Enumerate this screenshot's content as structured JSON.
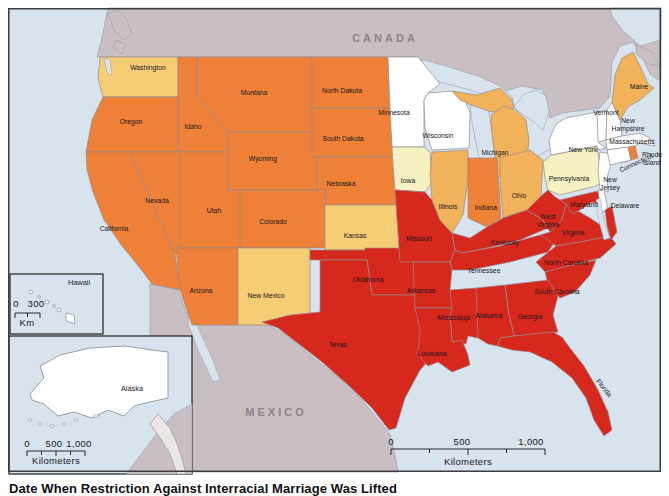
{
  "figure": {
    "caption": "Date When Restriction Against Interracial Marriage Was Lifted"
  },
  "map": {
    "region_labels": {
      "north": "CANADA",
      "south": "MEXICO"
    },
    "palette": {
      "ocean": "#D7E4EE",
      "foreign_land": "#C9BFC3",
      "no_law": "#FFFFFF",
      "pale_yellow": "#F5F1C0",
      "light_goldenrod": "#F6CC74",
      "goldenrod": "#F1B25A",
      "orange": "#EF8038",
      "red": "#D7281D",
      "state_border": "#97898E"
    },
    "categories": [
      {
        "id": "no_law",
        "color": "#FFFFFF",
        "states": [
          "Minnesota",
          "Wisconsin",
          "New York",
          "Vermont",
          "New Hampshire",
          "Massachusetts",
          "Connecticut",
          "New Jersey",
          "Delaware",
          "Alaska",
          "Hawaii"
        ]
      },
      {
        "id": "pale_yellow",
        "color": "#F5F1C0",
        "states": [
          "Iowa",
          "Pennsylvania"
        ]
      },
      {
        "id": "light_goldenrod",
        "color": "#F6CC74",
        "states": [
          "Washington",
          "Kansas",
          "New Mexico"
        ]
      },
      {
        "id": "goldenrod",
        "color": "#F1B25A",
        "states": [
          "Illinois",
          "Michigan",
          "Ohio",
          "Maine"
        ]
      },
      {
        "id": "orange",
        "color": "#EF8038",
        "states": [
          "Oregon",
          "Idaho",
          "Montana",
          "Wyoming",
          "Nevada",
          "Utah",
          "California",
          "Colorado",
          "Arizona",
          "North Dakota",
          "South Dakota",
          "Nebraska",
          "Indiana",
          "Rhode Island"
        ]
      },
      {
        "id": "red",
        "color": "#D7281D",
        "states": [
          "Missouri",
          "Oklahoma",
          "Texas",
          "Arkansas",
          "Louisiana",
          "Kentucky",
          "Tennessee",
          "Mississippi",
          "Alabama",
          "Georgia",
          "Florida",
          "South Carolina",
          "North Carolina",
          "Virginia",
          "West Virginia",
          "Maryland"
        ]
      }
    ],
    "state_categories": {
      "washington": "light_goldenrod",
      "oregon": "orange",
      "california": "orange",
      "nevada": "orange",
      "idaho": "orange",
      "montana": "orange",
      "wyoming": "orange",
      "utah": "orange",
      "arizona": "orange",
      "colorado": "orange",
      "new_mexico": "light_goldenrod",
      "north_dakota": "orange",
      "south_dakota": "orange",
      "nebraska": "orange",
      "kansas": "light_goldenrod",
      "oklahoma": "red",
      "texas": "red",
      "minnesota": "no_law",
      "iowa": "pale_yellow",
      "missouri": "red",
      "arkansas": "red",
      "louisiana": "red",
      "wisconsin": "no_law",
      "illinois": "goldenrod",
      "michigan": "goldenrod",
      "indiana": "orange",
      "ohio": "goldenrod",
      "kentucky": "red",
      "tennessee": "red",
      "mississippi": "red",
      "alabama": "red",
      "georgia": "red",
      "florida": "red",
      "south_carolina": "red",
      "north_carolina": "red",
      "virginia": "red",
      "west_virginia": "red",
      "maryland": "red",
      "delaware": "no_law",
      "pennsylvania": "pale_yellow",
      "new_jersey": "no_law",
      "new_york": "no_law",
      "vermont": "no_law",
      "new_hampshire": "no_law",
      "massachusetts": "no_law",
      "connecticut": "no_law",
      "rhode_island": "orange",
      "maine": "goldenrod",
      "alaska": "no_law",
      "hawaii": "no_law"
    },
    "labels": [
      {
        "id": "washington",
        "text": "Washington",
        "x": 148,
        "y": 68
      },
      {
        "id": "oregon",
        "text": "Oregon",
        "x": 131,
        "y": 122
      },
      {
        "id": "california",
        "text": "California",
        "x": 114,
        "y": 229
      },
      {
        "id": "nevada",
        "text": "Nevada",
        "x": 157,
        "y": 201
      },
      {
        "id": "idaho",
        "text": "Idaho",
        "x": 193,
        "y": 127
      },
      {
        "id": "montana",
        "text": "Montana",
        "x": 254,
        "y": 93
      },
      {
        "id": "wyoming",
        "text": "Wyoming",
        "x": 263,
        "y": 159
      },
      {
        "id": "utah",
        "text": "Utah",
        "x": 214,
        "y": 211
      },
      {
        "id": "arizona",
        "text": "Arizona",
        "x": 201,
        "y": 291
      },
      {
        "id": "colorado",
        "text": "Colorado",
        "x": 273,
        "y": 222
      },
      {
        "id": "new-mexico",
        "text": "New Mexico",
        "x": 266,
        "y": 296
      },
      {
        "id": "north-dakota",
        "text": "North Dakota",
        "x": 342,
        "y": 91
      },
      {
        "id": "south-dakota",
        "text": "South Dakota",
        "x": 343,
        "y": 139
      },
      {
        "id": "nebraska",
        "text": "Nebraska",
        "x": 341,
        "y": 184
      },
      {
        "id": "kansas",
        "text": "Kansas",
        "x": 355,
        "y": 236
      },
      {
        "id": "oklahoma",
        "text": "Oklahoma",
        "x": 368,
        "y": 280
      },
      {
        "id": "texas",
        "text": "Texas",
        "x": 338,
        "y": 345
      },
      {
        "id": "minnesota",
        "text": "Minnesota",
        "x": 394,
        "y": 113
      },
      {
        "id": "iowa",
        "text": "Iowa",
        "x": 408,
        "y": 181
      },
      {
        "id": "missouri",
        "text": "Missouri",
        "x": 419,
        "y": 239
      },
      {
        "id": "arkansas",
        "text": "Arkansas",
        "x": 421,
        "y": 291
      },
      {
        "id": "louisiana",
        "text": "Louisiana",
        "x": 432,
        "y": 354
      },
      {
        "id": "wisconsin",
        "text": "Wisconsin",
        "x": 438,
        "y": 136
      },
      {
        "id": "illinois",
        "text": "Illinois",
        "x": 448,
        "y": 207
      },
      {
        "id": "michigan",
        "text": "Michigan",
        "x": 495,
        "y": 153
      },
      {
        "id": "indiana",
        "text": "Indiana",
        "x": 486,
        "y": 208
      },
      {
        "id": "ohio",
        "text": "Ohio",
        "x": 519,
        "y": 196
      },
      {
        "id": "kentucky",
        "text": "Kentucky",
        "x": 505,
        "y": 243
      },
      {
        "id": "tennessee",
        "text": "Tennessee",
        "x": 484,
        "y": 271
      },
      {
        "id": "mississippi",
        "text": "Mississippi",
        "x": 454,
        "y": 318
      },
      {
        "id": "alabama",
        "text": "Alabama",
        "x": 489,
        "y": 316
      },
      {
        "id": "georgia",
        "text": "Georgia",
        "x": 530,
        "y": 317
      },
      {
        "id": "florida",
        "text": "Florida",
        "x": 604,
        "y": 388,
        "rot": 52
      },
      {
        "id": "south-carolina",
        "text": "South Carolina",
        "x": 557,
        "y": 292
      },
      {
        "id": "north-carolina",
        "text": "North Carolina",
        "x": 566,
        "y": 263
      },
      {
        "id": "virginia",
        "text": "Virginia",
        "x": 573,
        "y": 233
      },
      {
        "id": "west-virginia",
        "text": "West\nVirginia",
        "x": 548,
        "y": 221
      },
      {
        "id": "maryland",
        "text": "Maryland",
        "x": 584,
        "y": 205
      },
      {
        "id": "delaware",
        "text": "Delaware",
        "x": 625,
        "y": 206
      },
      {
        "id": "pennsylvania",
        "text": "Pennsylvania",
        "x": 569,
        "y": 179
      },
      {
        "id": "new-jersey",
        "text": "New\nJersey",
        "x": 610,
        "y": 184
      },
      {
        "id": "new-york",
        "text": "New York",
        "x": 583,
        "y": 150
      },
      {
        "id": "vermont",
        "text": "Vermont",
        "x": 606,
        "y": 113
      },
      {
        "id": "new-hampshire",
        "text": "New\nHampshire",
        "x": 628,
        "y": 125
      },
      {
        "id": "massachusetts",
        "text": "Massachusetts",
        "x": 632,
        "y": 142
      },
      {
        "id": "connecticut",
        "text": "Connecticut",
        "x": 636,
        "y": 163,
        "rot": -25
      },
      {
        "id": "rhode-island",
        "text": "Rhode\nIsland",
        "x": 652,
        "y": 159
      },
      {
        "id": "maine",
        "text": "Maine",
        "x": 639,
        "y": 87
      },
      {
        "id": "hawaii",
        "text": "Hawaii",
        "x": 79,
        "y": 283,
        "cls": "inset-name"
      },
      {
        "id": "alaska",
        "text": "Alaska",
        "x": 132,
        "y": 389,
        "cls": "inset-name"
      },
      {
        "id": "canada",
        "text": "CANADA",
        "x": 385,
        "y": 38,
        "cls": "region"
      },
      {
        "id": "mexico",
        "text": "MEXICO",
        "x": 276,
        "y": 412,
        "cls": "region"
      },
      {
        "id": "main-scale-0",
        "text": "0",
        "x": 391,
        "y": 442,
        "cls": "scale"
      },
      {
        "id": "main-scale-500",
        "text": "500",
        "x": 462,
        "y": 442,
        "cls": "scale"
      },
      {
        "id": "main-scale-1000",
        "text": "1,000",
        "x": 531,
        "y": 442,
        "cls": "scale"
      },
      {
        "id": "main-scale-unit",
        "text": "Kilometers",
        "x": 468,
        "y": 462,
        "cls": "scale"
      },
      {
        "id": "alaska-scale-0",
        "text": "0",
        "x": 27,
        "y": 444,
        "cls": "scale"
      },
      {
        "id": "alaska-scale-500",
        "text": "500",
        "x": 54,
        "y": 444,
        "cls": "scale"
      },
      {
        "id": "alaska-scale-1000",
        "text": "1,000",
        "x": 79,
        "y": 444,
        "cls": "scale"
      },
      {
        "id": "alaska-scale-unit",
        "text": "Kilometers",
        "x": 56,
        "y": 461,
        "cls": "scale"
      },
      {
        "id": "hawaii-scale-0",
        "text": "0",
        "x": 16,
        "y": 304,
        "cls": "scale"
      },
      {
        "id": "hawaii-scale-300",
        "text": "300",
        "x": 36,
        "y": 304,
        "cls": "scale"
      },
      {
        "id": "hawaii-scale-unit",
        "text": "Km",
        "x": 27,
        "y": 323,
        "cls": "scale"
      }
    ]
  }
}
